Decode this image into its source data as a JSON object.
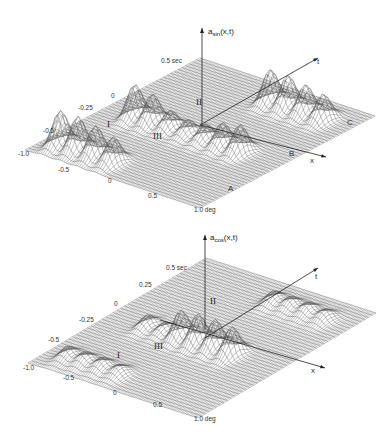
{
  "chart_data": [
    {
      "type": "surface",
      "title": "a_sin(x,t)",
      "zlabel": {
        "main": "a",
        "sub": "sin",
        "args": "(x,t)"
      },
      "xlabel": "x",
      "tlabel": "t",
      "x_ticks": [
        "-1.0",
        "-0.5",
        "0",
        "0.5",
        "1.0 deg"
      ],
      "t_ticks": [
        "-0.5",
        "-0.25",
        "0",
        "0.5 sec"
      ],
      "region_labels": [
        "I",
        "II",
        "III"
      ],
      "line_labels": [
        "A",
        "B",
        "C"
      ],
      "xlim": [
        -1.0,
        1.0
      ],
      "tlim": [
        -0.5,
        0.5
      ],
      "peaks": [
        {
          "x": -0.8,
          "t": -0.4,
          "h": 1.0,
          "w": 0.05
        },
        {
          "x": -0.6,
          "t": -0.4,
          "h": 1.0,
          "w": 0.05
        },
        {
          "x": -0.4,
          "t": -0.4,
          "h": 0.9,
          "w": 0.05
        },
        {
          "x": -0.2,
          "t": -0.4,
          "h": 0.75,
          "w": 0.05
        },
        {
          "x": -0.65,
          "t": -0.05,
          "h": 0.95,
          "w": 0.05
        },
        {
          "x": -0.45,
          "t": -0.05,
          "h": 0.85,
          "w": 0.05
        },
        {
          "x": -0.25,
          "t": -0.05,
          "h": 0.55,
          "w": 0.05
        },
        {
          "x": -0.05,
          "t": -0.05,
          "h": 0.45,
          "w": 0.05
        },
        {
          "x": 0.15,
          "t": -0.05,
          "h": 0.5,
          "w": 0.05
        },
        {
          "x": 0.35,
          "t": -0.05,
          "h": 0.7,
          "w": 0.05
        },
        {
          "x": 0.55,
          "t": -0.05,
          "h": 0.8,
          "w": 0.05
        },
        {
          "x": 0.1,
          "t": 0.35,
          "h": 0.95,
          "w": 0.05
        },
        {
          "x": 0.3,
          "t": 0.35,
          "h": 0.95,
          "w": 0.05
        },
        {
          "x": 0.5,
          "t": 0.35,
          "h": 0.85,
          "w": 0.05
        },
        {
          "x": 0.7,
          "t": 0.35,
          "h": 0.75,
          "w": 0.05
        }
      ]
    },
    {
      "type": "surface",
      "title": "a_cos(x,t)",
      "zlabel": {
        "main": "a",
        "sub": "cos",
        "args": "(x,t)"
      },
      "xlabel": "x",
      "tlabel": "t",
      "x_ticks": [
        "-1.0",
        "-0.5",
        "0",
        "0.5",
        "1.0 deg"
      ],
      "t_ticks": [
        "-0.5",
        "-0.25",
        "0",
        "0.25",
        "0.5 sec"
      ],
      "region_labels": [
        "I",
        "II",
        "III"
      ],
      "xlim": [
        -1.0,
        1.0
      ],
      "tlim": [
        -0.5,
        0.5
      ],
      "peaks": [
        {
          "x": -0.75,
          "t": -0.4,
          "h": 0.35,
          "w": 0.06
        },
        {
          "x": -0.55,
          "t": -0.4,
          "h": 0.35,
          "w": 0.06
        },
        {
          "x": -0.35,
          "t": -0.4,
          "h": 0.35,
          "w": 0.06
        },
        {
          "x": -0.15,
          "t": -0.4,
          "h": 0.3,
          "w": 0.06
        },
        {
          "x": -0.55,
          "t": -0.05,
          "h": 0.35,
          "w": 0.05
        },
        {
          "x": -0.35,
          "t": -0.05,
          "h": 0.3,
          "w": 0.05
        },
        {
          "x": -0.15,
          "t": -0.05,
          "h": 0.8,
          "w": 0.05
        },
        {
          "x": 0.05,
          "t": -0.05,
          "h": 0.85,
          "w": 0.05
        },
        {
          "x": 0.25,
          "t": -0.05,
          "h": 0.85,
          "w": 0.05
        },
        {
          "x": 0.45,
          "t": -0.05,
          "h": 0.8,
          "w": 0.05
        },
        {
          "x": 0.1,
          "t": 0.35,
          "h": 0.35,
          "w": 0.06
        },
        {
          "x": 0.3,
          "t": 0.35,
          "h": 0.35,
          "w": 0.06
        },
        {
          "x": 0.5,
          "t": 0.35,
          "h": 0.35,
          "w": 0.06
        },
        {
          "x": 0.7,
          "t": 0.35,
          "h": 0.3,
          "w": 0.06
        }
      ]
    }
  ]
}
